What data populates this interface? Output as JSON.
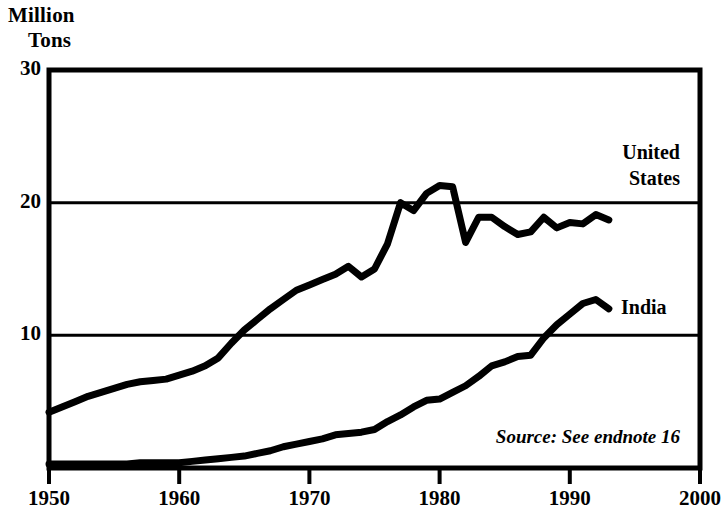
{
  "chart_data": {
    "type": "line",
    "title": "Million Tons",
    "title_line1": "Million",
    "title_line2": "Tons",
    "xlabel": "",
    "ylabel": "Million Tons",
    "xlim": [
      1950,
      2000
    ],
    "ylim": [
      0,
      30
    ],
    "xticks": [
      1950,
      1960,
      1970,
      1980,
      1990,
      2000
    ],
    "xtick_labels": [
      "1950",
      "1960",
      "1970",
      "1980",
      "1990",
      "2000"
    ],
    "yticks": [
      10,
      20,
      30
    ],
    "ytick_labels": [
      "10",
      "20",
      "30"
    ],
    "grid": "horizontal gridlines at 10 and 20",
    "legend_position": "inline labels at end of each series",
    "annotation": "Source: See endnote 16",
    "line_color": "#000000",
    "series": [
      {
        "name": "United States",
        "label": "United States",
        "label_line1": "United",
        "label_line2": "States",
        "x": [
          1950,
          1951,
          1952,
          1953,
          1954,
          1955,
          1956,
          1957,
          1958,
          1959,
          1960,
          1961,
          1962,
          1963,
          1964,
          1965,
          1966,
          1967,
          1968,
          1969,
          1970,
          1971,
          1972,
          1973,
          1974,
          1975,
          1976,
          1977,
          1978,
          1979,
          1980,
          1981,
          1982,
          1983,
          1984,
          1985,
          1986,
          1987,
          1988,
          1989,
          1990,
          1991,
          1992,
          1993
        ],
        "values": [
          4.2,
          4.6,
          5.0,
          5.4,
          5.7,
          6.0,
          6.3,
          6.5,
          6.6,
          6.7,
          7.0,
          7.3,
          7.7,
          8.3,
          9.4,
          10.4,
          11.2,
          12.0,
          12.7,
          13.4,
          13.8,
          14.2,
          14.6,
          15.2,
          14.4,
          15.0,
          16.9,
          20.0,
          19.4,
          20.7,
          21.3,
          21.2,
          17.0,
          18.9,
          18.9,
          18.2,
          17.6,
          17.8,
          18.9,
          18.1,
          18.5,
          18.4,
          19.1,
          18.7
        ]
      },
      {
        "name": "India",
        "label": "India",
        "x": [
          1950,
          1951,
          1952,
          1953,
          1954,
          1955,
          1956,
          1957,
          1958,
          1959,
          1960,
          1961,
          1962,
          1963,
          1964,
          1965,
          1966,
          1967,
          1968,
          1969,
          1970,
          1971,
          1972,
          1973,
          1974,
          1975,
          1976,
          1977,
          1978,
          1979,
          1980,
          1981,
          1982,
          1983,
          1984,
          1985,
          1986,
          1987,
          1988,
          1989,
          1990,
          1991,
          1992,
          1993
        ],
        "values": [
          0.3,
          0.3,
          0.3,
          0.3,
          0.3,
          0.3,
          0.3,
          0.4,
          0.4,
          0.4,
          0.4,
          0.5,
          0.6,
          0.7,
          0.8,
          0.9,
          1.1,
          1.3,
          1.6,
          1.8,
          2.0,
          2.2,
          2.5,
          2.6,
          2.7,
          2.9,
          3.5,
          4.0,
          4.6,
          5.1,
          5.2,
          5.7,
          6.2,
          6.9,
          7.7,
          8.0,
          8.4,
          8.5,
          9.8,
          10.8,
          11.6,
          12.4,
          12.7,
          12.0
        ]
      }
    ]
  },
  "plot_area": {
    "left": 49,
    "right": 700,
    "top": 70,
    "bottom": 468
  }
}
